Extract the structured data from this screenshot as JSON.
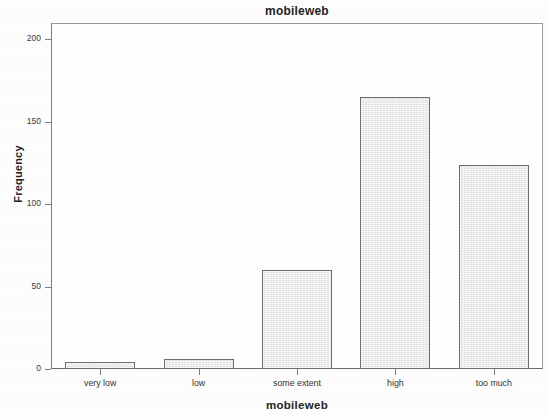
{
  "chart_data": {
    "type": "bar",
    "title": "mobileweb",
    "xlabel": "mobileweb",
    "ylabel": "Frequency",
    "categories": [
      "very low",
      "low",
      "some extent",
      "high",
      "too much"
    ],
    "values": [
      4,
      6,
      60,
      165,
      124
    ],
    "ylim": [
      0,
      210
    ],
    "yticks": [
      0,
      50,
      100,
      150,
      200
    ],
    "ytick_labels": [
      "0",
      "50",
      "100",
      "150",
      "200"
    ],
    "grid": false,
    "legend": null,
    "bar_fill_color": "#e9e9e9",
    "bar_edge_color": "#6f6f6f",
    "background_color": "#fdfdfd",
    "axis_color": "#7d7d7d"
  }
}
